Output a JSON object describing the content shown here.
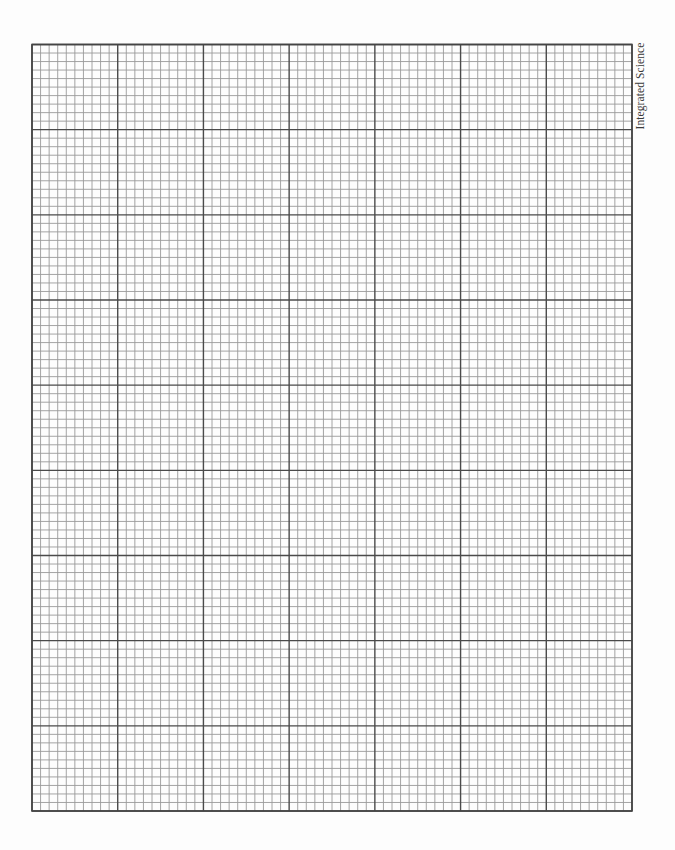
{
  "document": {
    "type": "graph-paper",
    "label": "Integrated Science"
  },
  "grid": {
    "left": 32,
    "top": 44.5,
    "right": 632,
    "bottom": 811,
    "major_columns": 7,
    "major_rows": 9,
    "minor_per_major": 10,
    "colors": {
      "major_line": "#4a4a4a",
      "minor_line": "#9a9a9a",
      "border": "#444444",
      "paper": "#fdfdfd"
    }
  }
}
